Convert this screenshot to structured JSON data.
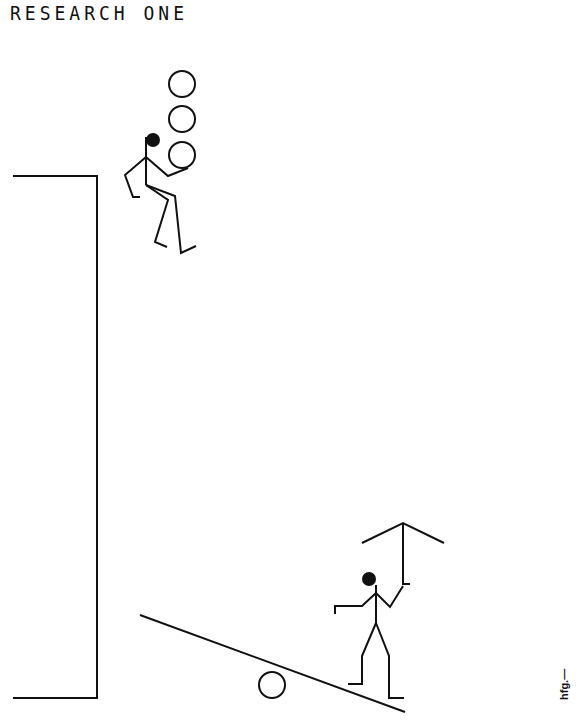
{
  "poster": {
    "title": "RESEARCH ONE",
    "credit": "hfg.—",
    "colors": {
      "background": "#ffffff",
      "ink": "#111111"
    }
  },
  "scene": {
    "wall": {
      "top_y": 176,
      "bottom_y": 698,
      "left_x": 13,
      "right_x": 97
    },
    "juggler": {
      "balls": 3,
      "description": "stick figure juggling three circles atop the wall"
    },
    "seesaw": {
      "from": [
        140,
        615
      ],
      "to": [
        405,
        712
      ],
      "fulcrum_ball": [
        272,
        685
      ]
    },
    "lifter": {
      "description": "stick figure on seesaw holding up a roof-like frame"
    }
  }
}
